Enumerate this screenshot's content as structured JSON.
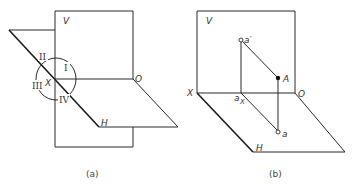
{
  "figure_a": {
    "caption": "(a)",
    "labels": {
      "v_plane": "V",
      "h_plane": "H",
      "x_axis": "X",
      "origin": "O",
      "quadrant_1": "I",
      "quadrant_2": "II",
      "quadrant_3": "III",
      "quadrant_4": "IV"
    }
  },
  "figure_b": {
    "caption": "(b)",
    "labels": {
      "v_plane": "V",
      "h_plane": "H",
      "x_axis": "X",
      "origin": "O",
      "point_A": "A",
      "v_projection": "a′",
      "h_projection": "a",
      "x_projection": "a",
      "x_projection_sub": "X"
    }
  }
}
